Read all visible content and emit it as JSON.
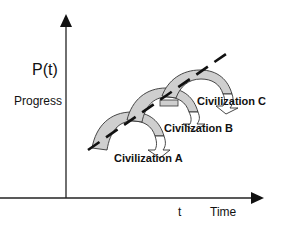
{
  "diagram": {
    "y_axis": {
      "symbol": "P(t)",
      "label": "Progress"
    },
    "x_axis": {
      "symbol": "t",
      "label": "Time"
    },
    "trend_line": {
      "style": "dashed",
      "description": "overall progress trend"
    },
    "civilizations": [
      {
        "name": "Civilization A"
      },
      {
        "name": "Civilization B"
      },
      {
        "name": "Civilization C"
      }
    ],
    "colors": {
      "line": "#111111",
      "arrow_fill": "#cfcfcf",
      "arrow_stroke": "#333333",
      "background": "#ffffff"
    }
  }
}
